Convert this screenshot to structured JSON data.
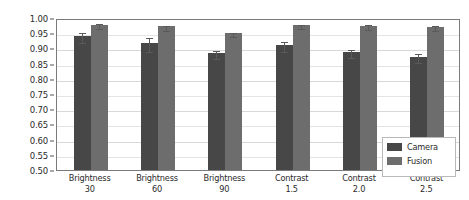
{
  "chart_data": {
    "type": "bar",
    "title": "",
    "xlabel": "",
    "ylabel": "",
    "ylim": [
      0.5,
      1.0
    ],
    "ytick_values": [
      0.5,
      0.55,
      0.6,
      0.65,
      0.7,
      0.75,
      0.8,
      0.85,
      0.9,
      0.95,
      1.0
    ],
    "ytick_labels": [
      "0.50",
      "0.55",
      "0.60",
      "0.65",
      "0.70",
      "0.75",
      "0.80",
      "0.85",
      "0.90",
      "0.95",
      "1.00"
    ],
    "grid": true,
    "legend_position": "lower right",
    "categories": [
      {
        "line1": "Brightness",
        "line2": "30"
      },
      {
        "line1": "Brightness",
        "line2": "60"
      },
      {
        "line1": "Brightness",
        "line2": "90"
      },
      {
        "line1": "Contrast",
        "line2": "1.5"
      },
      {
        "line1": "Contrast",
        "line2": "2.0"
      },
      {
        "line1": "Contrast",
        "line2": "2.5"
      }
    ],
    "series": [
      {
        "name": "Camera",
        "color": "#474747",
        "values": [
          0.94,
          0.918,
          0.885,
          0.912,
          0.888,
          0.873
        ],
        "errors": [
          0.016,
          0.023,
          0.013,
          0.017,
          0.012,
          0.015
        ]
      },
      {
        "name": "Fusion",
        "color": "#6d6d6d",
        "values": [
          0.978,
          0.973,
          0.95,
          0.977,
          0.974,
          0.972
        ],
        "errors": [
          0.008,
          0.008,
          0.007,
          0.007,
          0.008,
          0.007
        ]
      }
    ],
    "legend_entries": [
      {
        "label": "Camera",
        "color": "#474747"
      },
      {
        "label": "Fusion",
        "color": "#6d6d6d"
      }
    ]
  },
  "figure": {
    "background": "#ffffff",
    "axis_color": "#7a7a7a",
    "grid_color": "#e4e4e4",
    "text_color": "#2b2b2b"
  }
}
